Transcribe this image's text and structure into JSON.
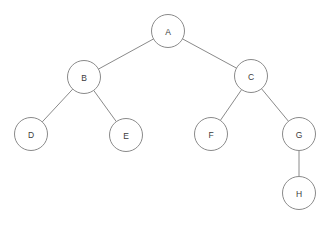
{
  "diagram": {
    "type": "tree",
    "canvas": {
      "width": 329,
      "height": 226,
      "background": "#ffffff"
    },
    "style": {
      "node_fill": "#ffffff",
      "node_stroke": "#8a8a8a",
      "edge_stroke": "#8a8a8a",
      "label_color": "#3b3b3b",
      "node_radius": 16.5,
      "stroke_width": 1
    },
    "root": "A",
    "nodes": [
      {
        "id": "A",
        "label": "A",
        "cx": 168,
        "cy": 31,
        "r": 16.5,
        "depth": 0
      },
      {
        "id": "B",
        "label": "B",
        "cx": 84,
        "cy": 77,
        "r": 16.5,
        "depth": 1
      },
      {
        "id": "C",
        "label": "C",
        "cx": 251,
        "cy": 76,
        "r": 16.5,
        "depth": 1
      },
      {
        "id": "D",
        "label": "D",
        "cx": 31,
        "cy": 134,
        "r": 16.5,
        "depth": 2
      },
      {
        "id": "E",
        "label": "E",
        "cx": 126,
        "cy": 135,
        "r": 16.5,
        "depth": 2
      },
      {
        "id": "F",
        "label": "F",
        "cx": 211,
        "cy": 134,
        "r": 16.5,
        "depth": 2
      },
      {
        "id": "G",
        "label": "G",
        "cx": 299,
        "cy": 134,
        "r": 16.5,
        "depth": 2
      },
      {
        "id": "H",
        "label": "H",
        "cx": 299,
        "cy": 193,
        "r": 16.5,
        "depth": 3
      }
    ],
    "edges": [
      {
        "from": "A",
        "to": "B",
        "side": "left"
      },
      {
        "from": "A",
        "to": "C",
        "side": "right"
      },
      {
        "from": "B",
        "to": "D",
        "side": "left"
      },
      {
        "from": "B",
        "to": "E",
        "side": "right"
      },
      {
        "from": "C",
        "to": "F",
        "side": "left"
      },
      {
        "from": "C",
        "to": "G",
        "side": "right"
      },
      {
        "from": "G",
        "to": "H",
        "side": "right"
      }
    ]
  }
}
